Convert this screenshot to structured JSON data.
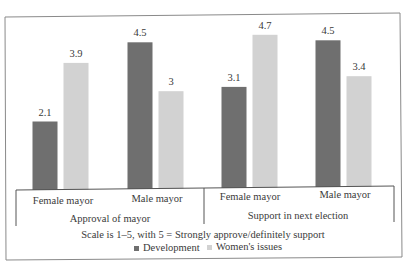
{
  "chart_data": {
    "type": "bar",
    "title": "",
    "xlabel": "Scale is 1–5, with 5 = Strongly approve/definitely support",
    "ylabel": "",
    "ylim": [
      0,
      5
    ],
    "grid": false,
    "legend_position": "bottom",
    "groups": [
      {
        "label": "Approval of mayor",
        "categories": [
          "Female mayor",
          "Male mayor"
        ]
      },
      {
        "label": "Support in next election",
        "categories": [
          "Female mayor",
          "Male mayor"
        ]
      }
    ],
    "categories": [
      "Female mayor",
      "Male mayor",
      "Female mayor",
      "Male mayor"
    ],
    "series": [
      {
        "name": "Development",
        "color": "#6f6f6f",
        "values": [
          2.1,
          4.5,
          3.1,
          4.5
        ],
        "labels": [
          "2.1",
          "4.5",
          "3.1",
          "4.5"
        ]
      },
      {
        "name": "Women's issues",
        "color": "#d2d2d2",
        "values": [
          3.9,
          3,
          4.7,
          3.4
        ],
        "labels": [
          "3.9",
          "3",
          "4.7",
          "3.4"
        ]
      }
    ]
  }
}
